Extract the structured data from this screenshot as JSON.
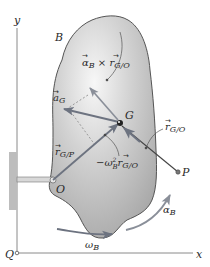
{
  "figure": {
    "axes": {
      "x_label": "x",
      "y_label": "y",
      "origin_label": "Q"
    },
    "body_label": "B",
    "points": {
      "G": "G",
      "O": "O",
      "P": "P"
    },
    "vectors": {
      "a_G": {
        "base": "a",
        "sub": "G"
      },
      "r_GP": {
        "base": "r",
        "sub": "G/P"
      },
      "r_GO": {
        "base": "r",
        "sub": "G/O"
      },
      "alpha_cross_r": {
        "base1": "α",
        "sub1": "B",
        "op": " × ",
        "base2": "r",
        "sub2": "G/O"
      },
      "centripetal": {
        "prefix": "−ω",
        "sup": "2",
        "sub1": "B",
        "base2": "r",
        "sub2": "G/O"
      }
    },
    "rotation": {
      "omega": {
        "base": "ω",
        "sub": "B"
      },
      "alpha": {
        "base": "α",
        "sub": "B"
      }
    },
    "colors": {
      "body_fill": "#b9b9b9",
      "body_highlight": "#f4f4f4",
      "body_outline": "#555555",
      "vector": "#6d7380",
      "line": "#333333",
      "support": "#bdbdbd",
      "axis": "#777777"
    }
  }
}
